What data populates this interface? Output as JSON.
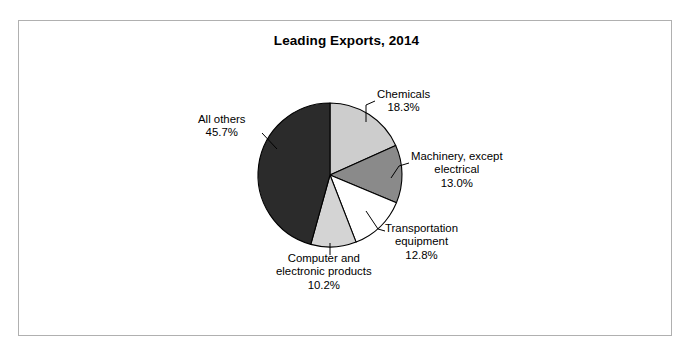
{
  "figure": {
    "title": "Leading Exports, 2014",
    "border_color": "#b0b0b0",
    "background": "#ffffff"
  },
  "chart_data": {
    "type": "pie",
    "title": "Leading Exports, 2014",
    "xlabel": "",
    "ylabel": "",
    "legend": "none",
    "start_angle_deg": 90,
    "direction": "clockwise",
    "categories": [
      "Chemicals",
      "Machinery, except electrical",
      "Transportation equipment",
      "Computer and electronic products",
      "All others"
    ],
    "values": [
      18.3,
      13.0,
      12.8,
      10.2,
      45.7
    ],
    "value_labels": [
      "18.3%",
      "13.0%",
      "12.8%",
      "10.2%",
      "45.7%"
    ],
    "colors": [
      "#cdcdcd",
      "#8a8a8a",
      "#ffffff",
      "#d4d4d4",
      "#2b2b2b"
    ],
    "slices": [
      {
        "name": "Chemicals",
        "value": 18.3,
        "value_label": "18.3%",
        "color": "#cdcdcd",
        "label_lines": [
          "Chemicals",
          "18.3%"
        ]
      },
      {
        "name": "Machinery, except electrical",
        "value": 13.0,
        "value_label": "13.0%",
        "color": "#8a8a8a",
        "label_lines": [
          "Machinery, except",
          "electrical",
          "13.0%"
        ]
      },
      {
        "name": "Transportation equipment",
        "value": 12.8,
        "value_label": "12.8%",
        "color": "#ffffff",
        "label_lines": [
          "Transportation",
          "equipment",
          "12.8%"
        ]
      },
      {
        "name": "Computer and electronic products",
        "value": 10.2,
        "value_label": "10.2%",
        "color": "#d4d4d4",
        "label_lines": [
          "Computer and",
          "electronic products",
          "10.2%"
        ]
      },
      {
        "name": "All others",
        "value": 45.7,
        "value_label": "45.7%",
        "color": "#2b2b2b",
        "label_lines": [
          "All others",
          "45.7%"
        ]
      }
    ]
  },
  "labels": {
    "chemicals": {
      "l1": "Chemicals",
      "l2": "18.3%",
      "l3": ""
    },
    "machinery": {
      "l1": "Machinery, except",
      "l2": "electrical",
      "l3": "13.0%"
    },
    "transportation": {
      "l1": "Transportation",
      "l2": "equipment",
      "l3": "12.8%"
    },
    "computer": {
      "l1": "Computer and",
      "l2": "electronic products",
      "l3": "10.2%"
    },
    "allothers": {
      "l1": "All others",
      "l2": "45.7%",
      "l3": ""
    }
  }
}
